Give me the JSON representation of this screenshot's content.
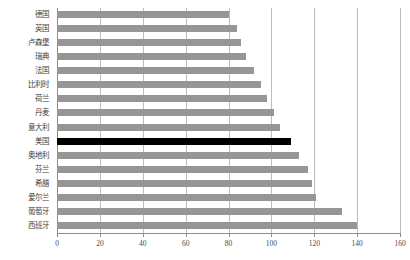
{
  "chart_data": {
    "type": "bar",
    "orientation": "horizontal",
    "title": "部分国家人均国内生产总值比较（指数）",
    "xlabel": "",
    "ylabel": "",
    "xlim": [
      0,
      160
    ],
    "xticks": [
      0,
      20,
      40,
      60,
      80,
      100,
      120,
      140,
      160
    ],
    "grid": true,
    "legend": "none",
    "categories": [
      "德国",
      "英国",
      "卢森堡",
      "瑞典",
      "法国",
      "比利时",
      "荷兰",
      "丹麦",
      "意大利",
      "美国",
      "奥地利",
      "芬兰",
      "希腊",
      "爱尔兰",
      "葡萄牙",
      "西班牙"
    ],
    "values": [
      80,
      84,
      86,
      88,
      92,
      95,
      98,
      101,
      104,
      109,
      113,
      117,
      119,
      121,
      133,
      140
    ],
    "highlight_category": "美国",
    "highlight_color": "#000000",
    "bar_color": "#969696"
  },
  "axis": {
    "tick_labels": [
      "0",
      "20",
      "40",
      "60",
      "80",
      "100",
      "120",
      "140",
      "160"
    ]
  },
  "colors": {
    "bar": "#969696",
    "highlight": "#000000",
    "grid": "#bdbdbd",
    "axis": "#8c8c8c",
    "text": "#3f3f3f",
    "background": "#ffffff"
  }
}
